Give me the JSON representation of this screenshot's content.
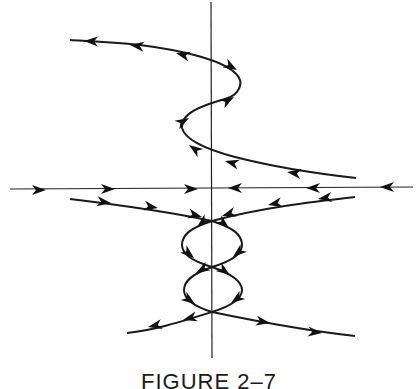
{
  "figure": {
    "caption": "FIGURE 2–7",
    "type": "phase-portrait",
    "axes": {
      "horizontal": "x-axis",
      "vertical": "y-axis"
    },
    "trajectories": [
      {
        "name": "s-curve-upper",
        "direction": "right-to-left"
      },
      {
        "name": "horizontal-axis-flow",
        "direction": "toward-origin"
      },
      {
        "name": "upper-separatrices",
        "direction": "inward"
      },
      {
        "name": "figure-eight-loops",
        "direction": "downward"
      },
      {
        "name": "lower-separatrices",
        "direction": "outward"
      }
    ]
  }
}
